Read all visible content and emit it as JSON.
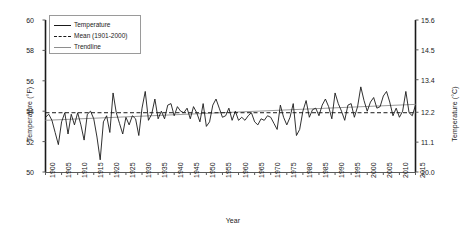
{
  "chart_data": {
    "type": "line",
    "title": "",
    "xlabel": "Year",
    "ylabel": "Temperature (°F)",
    "ylabel_secondary": "Temperature (°C)",
    "xlim": [
      1900,
      2015
    ],
    "ylim": [
      50,
      60
    ],
    "ylim_secondary": [
      10.0,
      15.6
    ],
    "grid": false,
    "legend_position": "top-left",
    "xticks": [
      1900,
      1905,
      1910,
      1915,
      1920,
      1925,
      1930,
      1935,
      1940,
      1945,
      1950,
      1955,
      1960,
      1965,
      1970,
      1975,
      1980,
      1985,
      1990,
      1995,
      2000,
      2005,
      2010,
      2015
    ],
    "yticks": [
      50,
      52,
      54,
      56,
      58,
      60
    ],
    "yticks_secondary": [
      10.0,
      11.1,
      12.2,
      13.4,
      14.5,
      15.6
    ],
    "legend": [
      {
        "label": "Temperature",
        "style": "solid",
        "color": "#1a1a1a"
      },
      {
        "label": "Mean (1901-2000)",
        "style": "dashed",
        "color": "#1a1a1a"
      },
      {
        "label": "Trendline",
        "style": "solid",
        "color": "#8e8e8e"
      }
    ],
    "series": [
      {
        "name": "Temperature",
        "x": [
          1900,
          1901,
          1902,
          1903,
          1904,
          1905,
          1906,
          1907,
          1908,
          1909,
          1910,
          1911,
          1912,
          1913,
          1914,
          1915,
          1916,
          1917,
          1918,
          1919,
          1920,
          1921,
          1922,
          1923,
          1924,
          1925,
          1926,
          1927,
          1928,
          1929,
          1930,
          1931,
          1932,
          1933,
          1934,
          1935,
          1936,
          1937,
          1938,
          1939,
          1940,
          1941,
          1942,
          1943,
          1944,
          1945,
          1946,
          1947,
          1948,
          1949,
          1950,
          1951,
          1952,
          1953,
          1954,
          1955,
          1956,
          1957,
          1958,
          1959,
          1960,
          1961,
          1962,
          1963,
          1964,
          1965,
          1966,
          1967,
          1968,
          1969,
          1970,
          1971,
          1972,
          1973,
          1974,
          1975,
          1976,
          1977,
          1978,
          1979,
          1980,
          1981,
          1982,
          1983,
          1984,
          1985,
          1986,
          1987,
          1988,
          1989,
          1990,
          1991,
          1992,
          1993,
          1994,
          1995,
          1996,
          1997,
          1998,
          1999,
          2000,
          2001,
          2002,
          2003,
          2004,
          2005,
          2006,
          2007,
          2008,
          2009,
          2010,
          2011,
          2012,
          2013,
          2014,
          2015
        ],
        "values": [
          53.6,
          53.8,
          53.4,
          52.6,
          51.8,
          53.3,
          53.9,
          52.5,
          53.8,
          53.1,
          53.9,
          53.1,
          52.1,
          53.8,
          54.0,
          53.5,
          52.3,
          50.8,
          53.3,
          53.7,
          52.6,
          55.2,
          53.9,
          53.2,
          52.5,
          53.6,
          53.1,
          53.7,
          53.5,
          52.4,
          54.2,
          55.3,
          53.4,
          53.8,
          54.8,
          53.5,
          54.0,
          53.5,
          54.4,
          54.5,
          53.7,
          54.3,
          54.0,
          53.9,
          54.2,
          53.5,
          54.3,
          53.9,
          53.3,
          54.5,
          53.0,
          53.3,
          54.4,
          54.8,
          54.2,
          53.6,
          53.7,
          54.2,
          53.4,
          54.0,
          53.4,
          53.6,
          53.4,
          53.7,
          53.9,
          53.3,
          53.1,
          53.5,
          53.4,
          53.7,
          53.6,
          53.2,
          52.8,
          54.4,
          53.6,
          53.1,
          53.6,
          54.5,
          52.4,
          52.8,
          54.0,
          54.7,
          53.6,
          54.1,
          54.2,
          53.7,
          54.4,
          54.8,
          54.3,
          53.5,
          55.2,
          54.5,
          54.0,
          53.4,
          54.4,
          54.5,
          53.6,
          54.3,
          55.6,
          54.7,
          54.0,
          54.6,
          54.9,
          54.2,
          54.3,
          55.0,
          55.3,
          54.6,
          53.7,
          54.2,
          53.6,
          54.0,
          55.3,
          53.9,
          53.7,
          54.4
        ]
      },
      {
        "name": "Mean (1901-2000)",
        "value": 53.9,
        "style": "dashed"
      },
      {
        "name": "Trendline",
        "x": [
          1900,
          2015
        ],
        "values": [
          53.4,
          54.45
        ],
        "style": "solid"
      }
    ]
  }
}
